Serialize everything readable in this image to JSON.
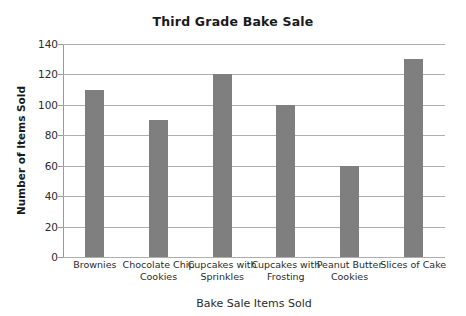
{
  "chart_data": {
    "type": "bar",
    "title": "Third Grade Bake Sale",
    "xlabel": "Bake Sale Items Sold",
    "ylabel": "Number of Items Sold",
    "categories": [
      "Brownies",
      "Chocolate Chip Cookies",
      "Cupcakes with Sprinkles",
      "Cupcakes with Frosting",
      "Peanut Butter Cookies",
      "Slices of Cake"
    ],
    "values": [
      110,
      90,
      120,
      100,
      60,
      130
    ],
    "ylim": [
      0,
      140
    ],
    "ytick_step": 20,
    "yticks": [
      0,
      20,
      40,
      60,
      80,
      100,
      120,
      140
    ],
    "ytick_labels": [
      "0",
      "20",
      "40",
      "60",
      "80",
      "100",
      "120",
      "140"
    ],
    "grid": true,
    "legend": false,
    "bar_color": "#7f7f7f",
    "gridline_color": "#aeaeae",
    "background_color": "#ffffff",
    "text_color": "#2b2b2b"
  }
}
